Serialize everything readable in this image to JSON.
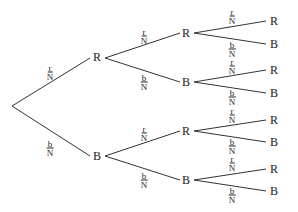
{
  "diagram": {
    "type": "probability-tree",
    "root": {
      "x": 12,
      "y": 106
    },
    "nodes": [
      {
        "id": "L1R",
        "label": "R",
        "x": 97,
        "y": 57,
        "parent": "root",
        "edge_x": 90,
        "edge_y": 58
      },
      {
        "id": "L1B",
        "label": "B",
        "x": 97,
        "y": 156,
        "parent": "root",
        "edge_x": 90,
        "edge_y": 156
      },
      {
        "id": "L2RR",
        "label": "R",
        "x": 186,
        "y": 33,
        "parent": "L1R",
        "edge_x": 180,
        "edge_y": 33
      },
      {
        "id": "L2RB",
        "label": "B",
        "x": 186,
        "y": 82,
        "parent": "L1R",
        "edge_x": 180,
        "edge_y": 82
      },
      {
        "id": "L2BR",
        "label": "R",
        "x": 186,
        "y": 131,
        "parent": "L1B",
        "edge_x": 180,
        "edge_y": 131
      },
      {
        "id": "L2BB",
        "label": "B",
        "x": 186,
        "y": 180,
        "parent": "L1B",
        "edge_x": 180,
        "edge_y": 180
      },
      {
        "id": "L3RRR",
        "label": "R",
        "x": 274,
        "y": 21,
        "parent": "L2RR",
        "edge_x": 266,
        "edge_y": 21
      },
      {
        "id": "L3RRB",
        "label": "B",
        "x": 274,
        "y": 44,
        "parent": "L2RR",
        "edge_x": 266,
        "edge_y": 44
      },
      {
        "id": "L3RBR",
        "label": "R",
        "x": 274,
        "y": 70,
        "parent": "L2RB",
        "edge_x": 266,
        "edge_y": 70
      },
      {
        "id": "L3RBB",
        "label": "B",
        "x": 274,
        "y": 93,
        "parent": "L2RB",
        "edge_x": 266,
        "edge_y": 93
      },
      {
        "id": "L3BRR",
        "label": "R",
        "x": 274,
        "y": 120,
        "parent": "L2BR",
        "edge_x": 266,
        "edge_y": 120
      },
      {
        "id": "L3BRB",
        "label": "B",
        "x": 274,
        "y": 142,
        "parent": "L2BR",
        "edge_x": 266,
        "edge_y": 142
      },
      {
        "id": "L3BBR",
        "label": "R",
        "x": 274,
        "y": 169,
        "parent": "L2BB",
        "edge_x": 266,
        "edge_y": 169
      },
      {
        "id": "L3BBB",
        "label": "B",
        "x": 274,
        "y": 191,
        "parent": "L2BB",
        "edge_x": 266,
        "edge_y": 191
      }
    ],
    "parent_anchor": {
      "root": {
        "x": 12,
        "y": 106
      },
      "L1R": {
        "x": 105,
        "y": 58
      },
      "L1B": {
        "x": 105,
        "y": 156
      },
      "L2RR": {
        "x": 194,
        "y": 33
      },
      "L2RB": {
        "x": 194,
        "y": 82
      },
      "L2BR": {
        "x": 194,
        "y": 131
      },
      "L2BB": {
        "x": 194,
        "y": 180
      }
    },
    "edge_labels": [
      {
        "num": "r",
        "den": "N",
        "x": 50,
        "y": 72
      },
      {
        "num": "b",
        "den": "N",
        "x": 50,
        "y": 148
      },
      {
        "num": "r",
        "den": "N",
        "x": 144,
        "y": 36
      },
      {
        "num": "b",
        "den": "N",
        "x": 144,
        "y": 82
      },
      {
        "num": "r",
        "den": "N",
        "x": 144,
        "y": 133
      },
      {
        "num": "b",
        "den": "N",
        "x": 144,
        "y": 180
      },
      {
        "num": "r",
        "den": "N",
        "x": 232,
        "y": 16
      },
      {
        "num": "b",
        "den": "N",
        "x": 232,
        "y": 49
      },
      {
        "num": "r",
        "den": "N",
        "x": 232,
        "y": 66
      },
      {
        "num": "b",
        "den": "N",
        "x": 232,
        "y": 97
      },
      {
        "num": "r",
        "den": "N",
        "x": 232,
        "y": 115
      },
      {
        "num": "b",
        "den": "N",
        "x": 232,
        "y": 146
      },
      {
        "num": "r",
        "den": "N",
        "x": 232,
        "y": 163
      },
      {
        "num": "b",
        "den": "N",
        "x": 232,
        "y": 195
      }
    ],
    "line_color": "#333333",
    "text_color": "#222222"
  }
}
